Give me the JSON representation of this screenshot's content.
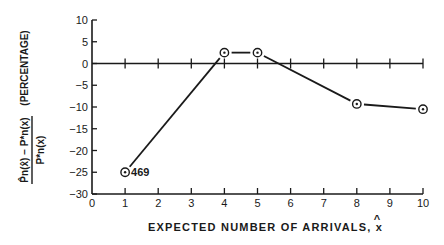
{
  "chart_data": {
    "type": "line",
    "title": "",
    "xlabel": "EXPECTED NUMBER OF ARRIVALS, x̂",
    "ylabel": "(P̂n(x̂) − P*n(x)) / P*n(x)  (PERCENTAGE)",
    "ylabel_parts": {
      "numerator": "P̂n(x̂) − P*n(x)",
      "denominator": "P*n(x)",
      "unit": "(PERCENTAGE)"
    },
    "xlim": [
      0,
      10
    ],
    "ylim": [
      -30,
      10
    ],
    "xticks": [
      0,
      1,
      2,
      3,
      4,
      5,
      6,
      7,
      8,
      9,
      10
    ],
    "yticks": [
      10,
      5,
      0,
      -5,
      -10,
      -15,
      -20,
      -25,
      -30
    ],
    "grid": false,
    "zero_line": true,
    "series": [
      {
        "name": "percentage error",
        "x": [
          1,
          4,
          5,
          8,
          10
        ],
        "y": [
          -25,
          2.5,
          2.5,
          -9.3,
          -10.5
        ],
        "marker": "circled-dot"
      }
    ],
    "annotations": [
      {
        "x": 1,
        "y": -25,
        "text": "469"
      }
    ]
  },
  "colors": {
    "ink": "#1a1a1a",
    "background": "#ffffff"
  }
}
